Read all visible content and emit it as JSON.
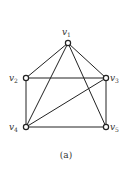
{
  "diagram": {
    "type": "graph",
    "caption": "(a)",
    "nodes": [
      {
        "id": "v1",
        "label": "v",
        "sub": "1",
        "x": 68,
        "y": 43,
        "lx": 62,
        "ly": 35
      },
      {
        "id": "v2",
        "label": "v",
        "sub": "2",
        "x": 26,
        "y": 78,
        "lx": 9,
        "ly": 81
      },
      {
        "id": "v3",
        "label": "v",
        "sub": "3",
        "x": 106,
        "y": 78,
        "lx": 110,
        "ly": 81
      },
      {
        "id": "v4",
        "label": "v",
        "sub": "4",
        "x": 26,
        "y": 127,
        "lx": 9,
        "ly": 130
      },
      {
        "id": "v5",
        "label": "v",
        "sub": "5",
        "x": 106,
        "y": 127,
        "lx": 110,
        "ly": 130
      }
    ],
    "edges": [
      [
        "v1",
        "v2"
      ],
      [
        "v1",
        "v3"
      ],
      [
        "v1",
        "v4"
      ],
      [
        "v1",
        "v5"
      ],
      [
        "v2",
        "v3"
      ],
      [
        "v2",
        "v4"
      ],
      [
        "v3",
        "v4"
      ],
      [
        "v3",
        "v5"
      ],
      [
        "v4",
        "v5"
      ]
    ],
    "colors": {
      "stroke": "#222222",
      "node_fill": "#ffffff",
      "text": "#333333"
    }
  }
}
